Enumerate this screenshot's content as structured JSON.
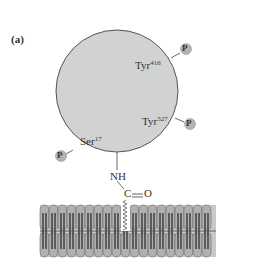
{
  "figure": {
    "panel_label": "(a)",
    "protein": {
      "shape": "circle",
      "fill": "#d2d2d2",
      "stroke": "#555555",
      "residues": [
        {
          "name": "Tyr",
          "number": "416",
          "phosphorylated": true
        },
        {
          "name": "Tyr",
          "number": "527",
          "phosphorylated": true
        },
        {
          "name": "Ser",
          "number": "17",
          "phosphorylated": true
        }
      ]
    },
    "phosphate_label": "P",
    "phosphate_fill": "#b4b4b4",
    "linker": {
      "amide_nh": "NH",
      "carbonyl_c": "C",
      "carbonyl_o": "O",
      "bond": "="
    },
    "membrane": {
      "type": "lipid bilayer",
      "head_fill": "#a8a8a8",
      "tail_fill": "#5a5a5a"
    }
  }
}
